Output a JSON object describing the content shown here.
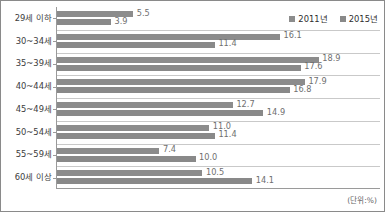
{
  "chart_data": {
    "type": "bar",
    "orientation": "horizontal",
    "title": "",
    "xlabel": "",
    "ylabel": "",
    "unit_note": "(단위:%)",
    "grid": true,
    "legend_position": "top-right",
    "xlim": [
      0,
      20
    ],
    "categories": [
      "29세 이하",
      "30~34세",
      "35~39세",
      "40~44세",
      "45~49세",
      "50~54세",
      "55~59세",
      "60세 이상"
    ],
    "series": [
      {
        "name": "2011년",
        "color": "#8c8c8c",
        "values": [
          5.5,
          16.1,
          18.9,
          17.9,
          12.7,
          11.0,
          7.4,
          10.5
        ],
        "labels": [
          "5.5",
          "16.1",
          "18.9",
          "17.9",
          "12.7",
          "11.0",
          "7.4",
          "10.5"
        ]
      },
      {
        "name": "2015년",
        "color": "#898989",
        "values": [
          3.9,
          11.4,
          17.6,
          16.8,
          14.9,
          11.4,
          10.0,
          14.1
        ],
        "labels": [
          "3.9",
          "11.4",
          "17.6",
          "16.8",
          "14.9",
          "11.4",
          "10.0",
          "14.1"
        ]
      }
    ]
  },
  "legend": {
    "items": [
      {
        "label": "2011년",
        "swatch": "legend-swatch-2011"
      },
      {
        "label": "2015년",
        "swatch": "legend-swatch-2015"
      }
    ]
  }
}
